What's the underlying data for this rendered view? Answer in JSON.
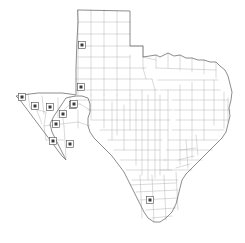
{
  "figure": {
    "width": 245,
    "height": 243,
    "background_color": "#ffffff"
  },
  "style": {
    "county_border_color": "#b4b4b4",
    "state_border_color": "#6e6e6e",
    "marker_fill_color": "#3a3a3a",
    "marker_outline_color": "#4a4a4a",
    "land_fill_color": "#ffffff"
  },
  "chart_data": {
    "type": "map",
    "xlabel": "",
    "ylabel": "",
    "region": "Texas",
    "projection_units": "pixels",
    "xlim": [
      0,
      245
    ],
    "ylim": [
      0,
      243
    ],
    "grid": false,
    "legend": "none",
    "marker_shape": "square",
    "marker_count": 11,
    "markers": [
      {
        "id": "m1",
        "area": "Panhandle north",
        "x": 82,
        "y": 45
      },
      {
        "id": "m2",
        "area": "Panhandle south",
        "x": 81,
        "y": 87
      },
      {
        "id": "m3",
        "area": "Far west corner",
        "x": 22,
        "y": 97
      },
      {
        "id": "m4",
        "area": "West 2",
        "x": 35,
        "y": 106
      },
      {
        "id": "m5",
        "area": "West 3",
        "x": 50,
        "y": 107
      },
      {
        "id": "m6",
        "area": "West central",
        "x": 63,
        "y": 114
      },
      {
        "id": "m7",
        "area": "Northwest edge",
        "x": 73,
        "y": 105
      },
      {
        "id": "m8",
        "area": "North of Big Bend",
        "x": 74,
        "y": 104
      },
      {
        "id": "m9",
        "area": "Big Bend north",
        "x": 56,
        "y": 124
      },
      {
        "id": "m10",
        "area": "Big Bend southwest",
        "x": 53,
        "y": 141
      },
      {
        "id": "m11",
        "area": "Big Bend southeast",
        "x": 70,
        "y": 144
      },
      {
        "id": "m12",
        "area": "South Texas",
        "x": 150,
        "y": 200
      }
    ],
    "county_grid_regions": [
      {
        "name": "Panhandle",
        "layout": "rectangular grid",
        "cols": 6,
        "rows": 7
      },
      {
        "name": "Central and East",
        "layout": "irregular polygons"
      },
      {
        "name": "Trans-Pecos",
        "layout": "large irregular counties"
      }
    ],
    "state_outline_features": [
      "Panhandle rectangle at north",
      "Red River boundary on north",
      "Sabine River boundary on east",
      "Gulf of Mexico coastline on southeast",
      "Rio Grande boundary on southwest",
      "El Paso western point"
    ]
  }
}
